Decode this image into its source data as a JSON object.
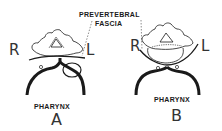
{
  "annotation": {
    "line1": "PREVERTEBRAL",
    "line2": "FASCIA"
  },
  "panels": [
    {
      "id": "A",
      "letter": "A",
      "left_label": "R",
      "right_label": "L",
      "structure_label": "PHARYNX"
    },
    {
      "id": "B",
      "letter": "B",
      "left_label": "R",
      "right_label": "L",
      "structure_label": "PHARYNX"
    }
  ],
  "colors": {
    "ink": "#1a1a1a",
    "background": "#ffffff"
  }
}
